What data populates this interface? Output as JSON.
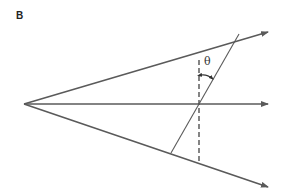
{
  "figure": {
    "panel_label": "B",
    "angle_label": "θ",
    "colors": {
      "line": "#5a5a5a",
      "background": "#ffffff"
    },
    "elements": {
      "rays": [
        {
          "name": "upper-ray",
          "from": [
            24,
            104
          ],
          "to": [
            268,
            32
          ]
        },
        {
          "name": "middle-ray",
          "from": [
            24,
            104
          ],
          "to": [
            268,
            104
          ]
        },
        {
          "name": "lower-ray",
          "from": [
            24,
            104
          ],
          "to": [
            268,
            187
          ]
        }
      ],
      "dashed_line": {
        "from": [
          199,
          60
        ],
        "to": [
          199,
          163
        ]
      },
      "slanted_line": {
        "from": [
          239,
          34
        ],
        "to": [
          171,
          153
        ]
      },
      "angle_arc": {
        "from": [
          201,
          75
        ],
        "to": [
          214,
          79
        ]
      }
    }
  }
}
